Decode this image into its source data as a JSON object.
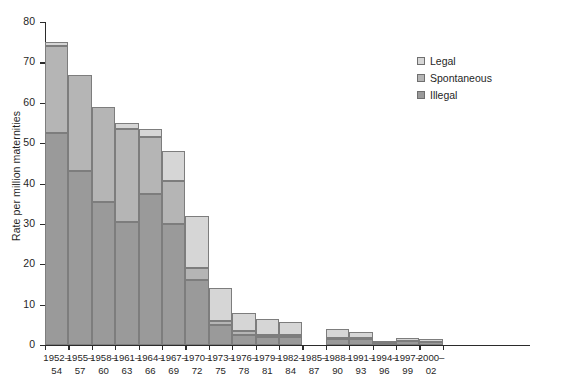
{
  "chart_data": {
    "type": "bar",
    "subtype": "stacked-bar",
    "title": "",
    "xlabel": "",
    "ylabel": "Rate per million maternities",
    "ylim": [
      0,
      80
    ],
    "yticks": [
      0,
      10,
      20,
      30,
      40,
      50,
      60,
      70,
      80
    ],
    "ytick_labels": [
      "0",
      "10",
      "20",
      "30",
      "40",
      "50",
      "60",
      "70",
      "80"
    ],
    "grid": false,
    "legend_position": "top-right",
    "categories": [
      "1952-54",
      "1955-57",
      "1958-60",
      "1961-63",
      "1964-66",
      "1967-69",
      "1970-72",
      "1973-75",
      "1976-78",
      "1979-81",
      "1982-84",
      "1985-87",
      "1988-90",
      "1991-93",
      "1994-96",
      "1997-99",
      "2000-02"
    ],
    "category_lines": [
      [
        "1952–",
        "54"
      ],
      [
        "1955–",
        "57"
      ],
      [
        "1958–",
        "60"
      ],
      [
        "1961–",
        "63"
      ],
      [
        "1964–",
        "66"
      ],
      [
        "1967–",
        "69"
      ],
      [
        "1970–",
        "72"
      ],
      [
        "1973–",
        "75"
      ],
      [
        "1976–",
        "78"
      ],
      [
        "1979–",
        "81"
      ],
      [
        "1982–",
        "84"
      ],
      [
        "1985–",
        "87"
      ],
      [
        "1988–",
        "90"
      ],
      [
        "1991–",
        "93"
      ],
      [
        "1994–",
        "96"
      ],
      [
        "1997–",
        "99"
      ],
      [
        "2000–",
        "02"
      ]
    ],
    "series": [
      {
        "name": "Illegal",
        "color": "#9a9a9a",
        "stack_order": 0,
        "values": [
          52.5,
          43.0,
          35.5,
          30.5,
          37.5,
          30.0,
          16.0,
          5.0,
          2.5,
          2.0,
          2.0,
          0.0,
          1.5,
          1.5,
          0.5,
          0.9,
          0.8
        ]
      },
      {
        "name": "Spontaneous",
        "color": "#b5b5b5",
        "stack_order": 1,
        "values": [
          21.5,
          24.0,
          23.5,
          23.0,
          14.0,
          10.5,
          3.0,
          1.0,
          1.0,
          0.5,
          0.5,
          0.0,
          0.3,
          0.3,
          0.0,
          0.0,
          0.0
        ]
      },
      {
        "name": "Legal",
        "color": "#d6d6d6",
        "stack_order": 2,
        "values": [
          1.0,
          0.0,
          0.0,
          1.5,
          2.0,
          7.5,
          13.0,
          8.0,
          4.5,
          4.0,
          3.2,
          0.0,
          2.2,
          1.4,
          0.3,
          0.8,
          0.6
        ]
      }
    ],
    "totals": [
      75.0,
      67.0,
      59.0,
      55.0,
      53.5,
      48.0,
      32.0,
      14.0,
      8.0,
      6.5,
      5.7,
      0.0,
      4.0,
      3.2,
      0.8,
      1.7,
      1.4
    ]
  },
  "legend": {
    "items": [
      {
        "label": "Legal",
        "color": "#d6d6d6"
      },
      {
        "label": "Spontaneous",
        "color": "#b5b5b5"
      },
      {
        "label": "Illegal",
        "color": "#9a9a9a"
      }
    ]
  },
  "axes": {
    "y_title": "Rate per million maternities"
  }
}
